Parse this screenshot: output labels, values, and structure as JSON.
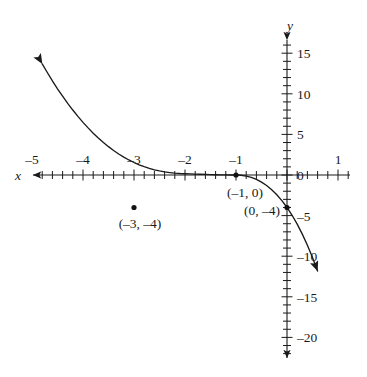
{
  "figure": {
    "kind": "cartesian-graph",
    "background": "#ffffff",
    "ink": "#1a1a1a"
  },
  "axes": {
    "x_label": "x",
    "y_label": "y",
    "x_ticks_labeled": [
      {
        "value": -5,
        "text": "–5"
      },
      {
        "value": -4,
        "text": "–4"
      },
      {
        "value": -3,
        "text": "–3"
      },
      {
        "value": -2,
        "text": "–2"
      },
      {
        "value": -1,
        "text": "–1"
      },
      {
        "value": 1,
        "text": "1"
      }
    ],
    "y_ticks_labeled": [
      {
        "value": 15,
        "text": "15"
      },
      {
        "value": 10,
        "text": "10"
      },
      {
        "value": 5,
        "text": "5"
      },
      {
        "value": 0,
        "text": "0"
      },
      {
        "value": -5,
        "text": "–5"
      },
      {
        "value": -10,
        "text": "–10"
      },
      {
        "value": -15,
        "text": "–15"
      },
      {
        "value": -20,
        "text": "–20"
      }
    ],
    "x_minor_step": 0.2,
    "y_minor_step": 1
  },
  "chart_data": {
    "type": "line",
    "title": "",
    "xlabel": "x",
    "ylabel": "y",
    "grid": false,
    "legend": false,
    "xlim": [
      -5.4,
      1.3
    ],
    "ylim": [
      -22.5,
      17.5
    ],
    "xticks": [
      -5,
      -4,
      -3,
      -2,
      -1,
      0,
      1
    ],
    "yticks": [
      15,
      10,
      5,
      0,
      -5,
      -10,
      -15,
      -20
    ],
    "equation": "y = -(x + 1)^2 (x + 4)",
    "series": [
      {
        "name": "y = -(x+1)^2(x+4)",
        "x": [
          -5.0,
          -4.9,
          -4.8,
          -4.7,
          -4.6,
          -4.5,
          -4.4,
          -4.3,
          -4.2,
          -4.1,
          -4.0,
          -3.9,
          -3.8,
          -3.7,
          -3.6,
          -3.5,
          -3.4,
          -3.3,
          -3.2,
          -3.1,
          -3.0,
          -2.9,
          -2.8,
          -2.7,
          -2.6,
          -2.5,
          -2.4,
          -2.3,
          -2.2,
          -2.1,
          -2.0,
          -1.9,
          -1.8,
          -1.7,
          -1.6,
          -1.5,
          -1.4,
          -1.3,
          -1.2,
          -1.1,
          -1.0,
          -0.9,
          -0.8,
          -0.7,
          -0.6,
          -0.5,
          -0.4,
          -0.3,
          -0.2,
          -0.1,
          0.0,
          0.1,
          0.2,
          0.3,
          0.4,
          0.5,
          0.6
        ],
        "y": [
          16.0,
          14.82,
          13.69,
          12.62,
          11.59,
          10.62,
          9.7,
          8.82,
          8.0,
          7.22,
          6.48,
          5.8,
          5.15,
          4.56,
          4.0,
          3.49,
          3.02,
          2.59,
          2.2,
          1.85,
          1.54,
          1.26,
          1.02,
          0.81,
          0.64,
          0.5,
          0.38,
          0.3,
          0.23,
          0.18,
          0.15,
          0.13,
          0.11,
          0.09,
          0.07,
          0.05,
          0.03,
          0.02,
          0.01,
          0.0,
          0.0,
          -0.03,
          -0.13,
          -0.3,
          -0.54,
          -0.88,
          -1.3,
          -1.81,
          -2.43,
          -3.16,
          -4.0,
          -4.96,
          -6.05,
          -7.28,
          -8.65,
          -10.16,
          -11.83
        ]
      }
    ],
    "marked_points": [
      {
        "x": -3,
        "y": -4,
        "label": "(–3, –4)"
      },
      {
        "x": -1,
        "y": 0,
        "label": "(–1, 0)"
      },
      {
        "x": 0,
        "y": -4,
        "label": "(0, –4)"
      }
    ],
    "arrows": [
      {
        "at": "upper-left",
        "direction": "up-left"
      },
      {
        "at": "lower-right",
        "direction": "down-right"
      },
      {
        "at": "x-axis-left",
        "direction": "left"
      },
      {
        "at": "y-axis-top",
        "direction": "up"
      },
      {
        "at": "y-axis-bottom",
        "direction": "down"
      }
    ]
  },
  "point_labels": {
    "p1": "(–3, –4)",
    "p2": "(–1, 0)",
    "p3": "(0, –4)"
  }
}
